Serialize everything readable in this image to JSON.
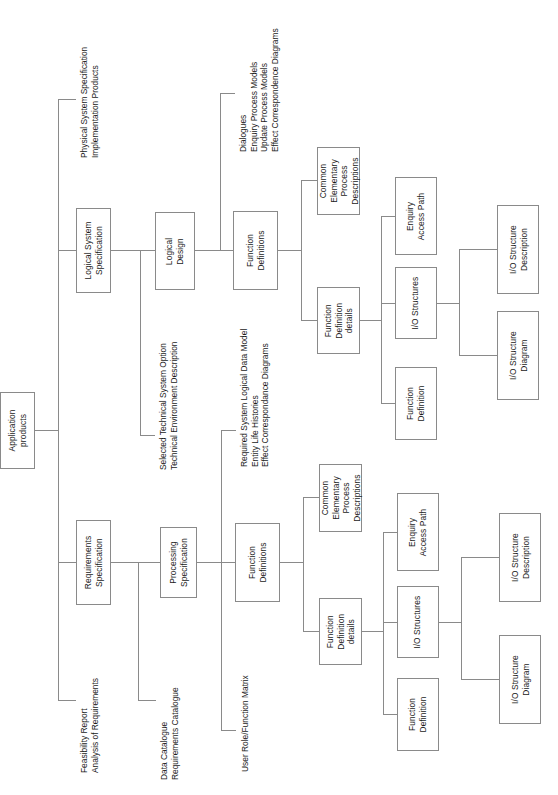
{
  "diagram": {
    "orientation": "rotated-90-ccw",
    "line_color": "#8a8a8a",
    "box_border_color": "#8a8a8a",
    "background": "#ffffff",
    "text_color": "#1a1a1a"
  },
  "nodes": {
    "root": "Application\nproducts",
    "requirements_specification": "Requirements\nSpecification",
    "logical_system_specification": "Logical System\nSpecification",
    "processing_specification": "Processing\nSpecification",
    "logical_design": "Logical\nDesign",
    "function_definitions_lower": "Function\nDefinitions",
    "function_definitions_upper": "Function\nDefinitions",
    "cepd_lower": "Common\nElementary\nProcess\nDescriptions",
    "cepd_upper": "Common\nElementary\nProcess\nDescriptions",
    "function_definition_details_lower": "Function\nDefinition\ndetails",
    "function_definition_details_upper": "Function\nDefinition\ndetails",
    "enquiry_access_path_lower": "Enquiry\nAccess Path",
    "enquiry_access_path_upper": "Enquiry\nAccess Path",
    "io_structures_lower": "I/O Structures",
    "io_structures_upper": "I/O Structures",
    "function_definition_lower": "Function\nDefinition",
    "function_definition_upper": "Function\nDefinition",
    "io_structure_description_lower": "I/O Structure\nDescription",
    "io_structure_description_upper": "I/O Structure\nDescription",
    "io_structure_diagram_lower": "I/O Structure\nDiagram",
    "io_structure_diagram_upper": "I/O Structure\nDiagram"
  },
  "annotations": {
    "physical_system_specification": "Physical System Specification\nImplementation Products",
    "dialogues_group": "Dialogues\nEnquiry Process Models\nUpdate Process Models\nEffect Correspondence Diagrams",
    "selected_technical_system_option": "Selected Technical System Option\nTechnical Environment Description",
    "required_system_logical_data_model": "Required System Logical Data Model\nEntity Life Histories\nEffect Correspondance Diagrams",
    "feasibility_report": "Feasibility Report\nAnalysis of Requirements",
    "data_catalogue": "Data Catalogue\nRequirements Catalogue",
    "user_role_function_matrix": "User Role/Function Matrix"
  }
}
